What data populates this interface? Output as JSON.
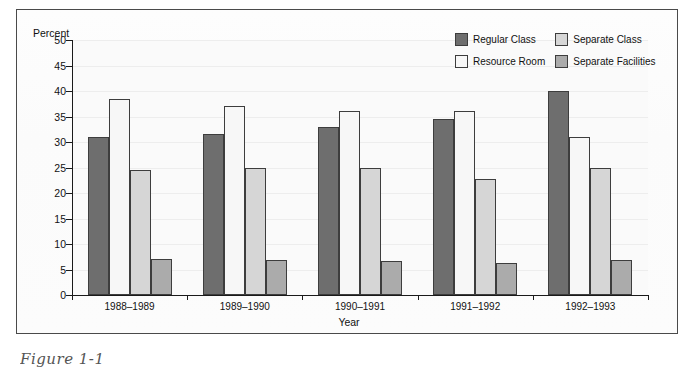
{
  "figure": {
    "caption": "Figure 1-1"
  },
  "axes": {
    "y_title": "Percent",
    "x_title": "Year",
    "y_ticks": [
      "50",
      "45",
      "40",
      "35",
      "30",
      "25",
      "20",
      "15",
      "10",
      "5",
      "0"
    ]
  },
  "legend": {
    "entries": [
      {
        "label": "Regular Class",
        "color": "#6e6e6e"
      },
      {
        "label": "Separate Class",
        "color": "#d6d6d6"
      },
      {
        "label": "Resource Room",
        "color": "#f7f7f7"
      },
      {
        "label": "Separate Facilities",
        "color": "#ababab"
      }
    ]
  },
  "chart_data": {
    "type": "bar",
    "title": "",
    "xlabel": "Year",
    "ylabel": "Percent",
    "ylim": [
      0,
      50
    ],
    "ytick_step": 5,
    "grid": true,
    "legend_position": "top-right",
    "categories": [
      "1988–1989",
      "1989–1990",
      "1990–1991",
      "1991–1992",
      "1992–1993"
    ],
    "series": [
      {
        "name": "Regular Class",
        "color": "#6e6e6e",
        "values": [
          31.0,
          31.5,
          33.0,
          34.5,
          40.0
        ]
      },
      {
        "name": "Resource Room",
        "color": "#f7f7f7",
        "values": [
          38.5,
          37.0,
          36.0,
          36.0,
          31.0
        ]
      },
      {
        "name": "Separate Class",
        "color": "#d6d6d6",
        "values": [
          24.5,
          25.0,
          25.0,
          22.8,
          25.0
        ]
      },
      {
        "name": "Separate Facilities",
        "color": "#ababab",
        "values": [
          7.0,
          6.8,
          6.7,
          6.3,
          6.8
        ]
      }
    ]
  }
}
